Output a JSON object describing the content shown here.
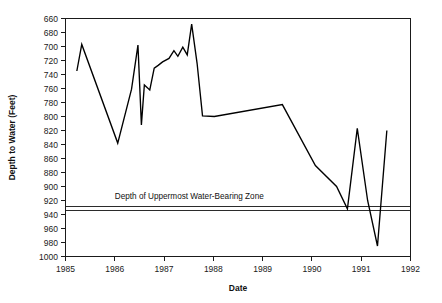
{
  "chart_data": {
    "type": "line",
    "title": "",
    "xlabel": "Date",
    "ylabel": "Depth to Water (Feet)",
    "xlim": [
      1985,
      1992
    ],
    "ylim": [
      660,
      1000
    ],
    "y_inverted": true,
    "grid": false,
    "legend": null,
    "x_ticks": [
      1985,
      1986,
      1987,
      1988,
      1989,
      1990,
      1991,
      1992
    ],
    "x_tick_labels": [
      "1985",
      "1986",
      "1987",
      "1988",
      "1989",
      "1990",
      "1991",
      "1992"
    ],
    "y_ticks": [
      660,
      680,
      700,
      720,
      740,
      760,
      780,
      800,
      820,
      840,
      860,
      880,
      900,
      920,
      940,
      960,
      980,
      1000
    ],
    "y_tick_labels": [
      "660",
      "680",
      "700",
      "720",
      "740",
      "760",
      "780",
      "800",
      "820",
      "840",
      "860",
      "880",
      "900",
      "920",
      "940",
      "960",
      "980",
      "1000"
    ],
    "series": [
      {
        "name": "Depth to Water",
        "x": [
          1985.23,
          1985.33,
          1986.06,
          1986.34,
          1986.47,
          1986.54,
          1986.6,
          1986.71,
          1986.8,
          1986.88,
          1986.97,
          1987.1,
          1987.2,
          1987.28,
          1987.38,
          1987.47,
          1987.56,
          1987.67,
          1987.78,
          1988.02,
          1989.4,
          1990.07,
          1990.5,
          1990.72,
          1990.92,
          1991.13,
          1991.33,
          1991.52
        ],
        "y": [
          735,
          697,
          838,
          761,
          698,
          812,
          755,
          762,
          731,
          727,
          722,
          717,
          706,
          714,
          701,
          712,
          668,
          724,
          799,
          800,
          783,
          870,
          900,
          932,
          817,
          920,
          985,
          820
        ]
      }
    ],
    "annotations": [
      {
        "name": "uppermost-water-bearing-zone",
        "text": "Depth of Uppermost Water-Bearing Zone",
        "y_top": 928,
        "y_bottom": 934,
        "label_x": 1986.0,
        "label_y": 918
      }
    ]
  },
  "colors": {
    "line": "#000000",
    "axis": "#1a1a1a",
    "text": "#111111",
    "zone": "#2b2b2b",
    "background": "#ffffff"
  }
}
